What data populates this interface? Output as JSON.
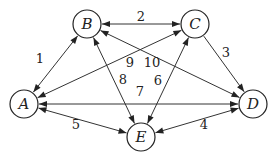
{
  "diagram": {
    "type": "directed-weighted-graph",
    "nodes": [
      {
        "id": "A",
        "label": "A"
      },
      {
        "id": "B",
        "label": "B"
      },
      {
        "id": "C",
        "label": "C"
      },
      {
        "id": "D",
        "label": "D"
      },
      {
        "id": "E",
        "label": "E"
      }
    ],
    "edges": [
      {
        "label": "1",
        "from": "A",
        "to": "B",
        "arrow_start": true,
        "arrow_end": true
      },
      {
        "label": "2",
        "from": "B",
        "to": "C",
        "arrow_start": true,
        "arrow_end": true
      },
      {
        "label": "3",
        "from": "C",
        "to": "D",
        "arrow_start": false,
        "arrow_end": true
      },
      {
        "label": "4",
        "from": "E",
        "to": "D",
        "arrow_start": true,
        "arrow_end": true
      },
      {
        "label": "5",
        "from": "A",
        "to": "E",
        "arrow_start": true,
        "arrow_end": true
      },
      {
        "label": "6",
        "from": "E",
        "to": "C",
        "arrow_start": true,
        "arrow_end": true
      },
      {
        "label": "7",
        "from": "A",
        "to": "D",
        "arrow_start": true,
        "arrow_end": true
      },
      {
        "label": "8",
        "from": "B",
        "to": "E",
        "arrow_start": true,
        "arrow_end": true
      },
      {
        "label": "9",
        "from": "A",
        "to": "C",
        "arrow_start": true,
        "arrow_end": true
      },
      {
        "label": "10",
        "from": "B",
        "to": "D",
        "arrow_start": true,
        "arrow_end": true
      }
    ]
  }
}
